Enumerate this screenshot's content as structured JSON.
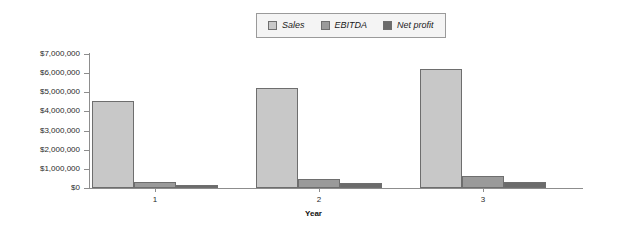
{
  "legend": {
    "position": "top-center",
    "items": [
      {
        "label": "Sales",
        "color": "#c8c8c8"
      },
      {
        "label": "EBITDA",
        "color": "#9a9a9a"
      },
      {
        "label": "Net profit",
        "color": "#6b6b6b"
      }
    ]
  },
  "axis": {
    "y_tick_labels": [
      "$7,000,000",
      "$6,000,000",
      "$5,000,000",
      "$4,000,000",
      "$3,000,000",
      "$2,000,000",
      "$1,000,000",
      "$0"
    ],
    "x_tick_labels": [
      "1",
      "2",
      "3"
    ],
    "x_title": "Year"
  },
  "chart_data": {
    "type": "bar",
    "title": "",
    "subtitle": "",
    "xlabel": "Year",
    "ylabel": "",
    "categories": [
      "1",
      "2",
      "3"
    ],
    "series": [
      {
        "name": "Sales",
        "color": "#c8c8c8",
        "values": [
          4550000,
          5200000,
          6200000
        ]
      },
      {
        "name": "EBITDA",
        "color": "#9a9a9a",
        "values": [
          330000,
          470000,
          630000
        ]
      },
      {
        "name": "Net profit",
        "color": "#6b6b6b",
        "values": [
          150000,
          250000,
          330000
        ]
      }
    ],
    "ylim": [
      0,
      7000000
    ],
    "ytick_step": 1000000,
    "ytick_values": [
      0,
      1000000,
      2000000,
      3000000,
      4000000,
      5000000,
      6000000,
      7000000
    ],
    "ytick_labels": [
      "$0",
      "$1,000,000",
      "$2,000,000",
      "$3,000,000",
      "$4,000,000",
      "$5,000,000",
      "$6,000,000",
      "$7,000,000"
    ],
    "grid": false,
    "legend_position": "top-center",
    "bar_border_color": "#6e6e6e",
    "axis_color": "#8d8d8d",
    "background": "#ffffff"
  },
  "geometry": {
    "plot_left": 89,
    "plot_right": 583,
    "baseline_y": 188,
    "top_y": 54,
    "bar_width": 42,
    "group_centers": [
      155,
      319,
      483
    ],
    "group_bar_offset": -63
  }
}
